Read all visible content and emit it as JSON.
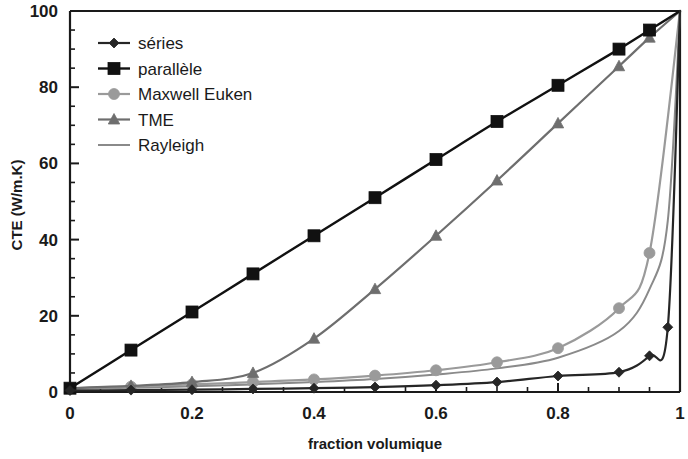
{
  "chart_data": {
    "type": "line",
    "title": "",
    "xlabel": "fraction volumique",
    "ylabel": "CTE (W/m.K)",
    "xlim": [
      0,
      1
    ],
    "ylim": [
      0,
      100
    ],
    "xticks": [
      0,
      0.2,
      0.4,
      0.6,
      0.8,
      1
    ],
    "xtick_labels": [
      "0",
      "0.2",
      "0.4",
      "0.6",
      "0.8",
      "1"
    ],
    "yticks": [
      0,
      20,
      40,
      60,
      80,
      100
    ],
    "ytick_labels": [
      "0",
      "20",
      "40",
      "60",
      "80",
      "100"
    ],
    "x_minor_step": 0.05,
    "y_minor_step": 5,
    "grid": false,
    "legend_position": "upper-left-inside",
    "series": [
      {
        "name": "séries",
        "color": "#262626",
        "marker": "diamond",
        "marker_size": 5,
        "line_width": 2.2,
        "x": [
          0,
          0.1,
          0.2,
          0.3,
          0.4,
          0.5,
          0.6,
          0.7,
          0.8,
          0.9,
          0.95,
          0.98,
          1
        ],
        "values": [
          0.4,
          0.5,
          0.6,
          0.8,
          1.0,
          1.3,
          1.8,
          2.6,
          4.2,
          5.2,
          9.5,
          17.0,
          100
        ]
      },
      {
        "name": "parallèle",
        "color": "#111111",
        "marker": "square",
        "marker_size": 6,
        "line_width": 2.4,
        "x": [
          0,
          0.1,
          0.2,
          0.3,
          0.4,
          0.5,
          0.6,
          0.7,
          0.8,
          0.9,
          0.95,
          1
        ],
        "values": [
          1.0,
          11.0,
          21.0,
          31.0,
          41.0,
          51.0,
          61.0,
          71.0,
          80.5,
          90.0,
          95.0,
          100
        ]
      },
      {
        "name": "Maxwell Euken",
        "color": "#9a9a9a",
        "marker": "circle",
        "marker_size": 5.5,
        "line_width": 2.2,
        "x": [
          0,
          0.1,
          0.2,
          0.3,
          0.4,
          0.5,
          0.6,
          0.7,
          0.8,
          0.9,
          0.95,
          1
        ],
        "values": [
          1.0,
          1.4,
          2.0,
          2.6,
          3.3,
          4.3,
          5.7,
          7.8,
          11.5,
          22.0,
          36.5,
          100
        ]
      },
      {
        "name": "TME",
        "color": "#6e6e6e",
        "marker": "triangle",
        "marker_size": 6,
        "line_width": 2.2,
        "x": [
          0,
          0.1,
          0.2,
          0.3,
          0.4,
          0.5,
          0.6,
          0.7,
          0.8,
          0.9,
          0.95,
          1
        ],
        "values": [
          1.0,
          1.6,
          2.6,
          5.0,
          14.0,
          27.0,
          41.0,
          55.5,
          70.5,
          85.5,
          93.0,
          100
        ]
      },
      {
        "name": "Rayleigh",
        "color": "#8a8a8a",
        "marker": "none",
        "marker_size": 0,
        "line_width": 2.0,
        "x": [
          0,
          0.1,
          0.2,
          0.3,
          0.4,
          0.5,
          0.6,
          0.7,
          0.8,
          0.9,
          0.95,
          0.98,
          1
        ],
        "values": [
          0.8,
          1.1,
          1.5,
          2.0,
          2.6,
          3.4,
          4.6,
          6.2,
          9.0,
          16.0,
          27.0,
          45.0,
          100
        ]
      }
    ]
  },
  "legend": {
    "items": [
      {
        "label": "séries"
      },
      {
        "label": "parallèle"
      },
      {
        "label": "Maxwell Euken"
      },
      {
        "label": "TME"
      },
      {
        "label": "Rayleigh"
      }
    ]
  }
}
